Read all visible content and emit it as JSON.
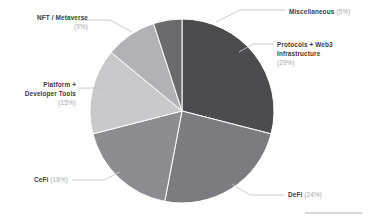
{
  "chart_data": {
    "type": "pie",
    "title": "",
    "subtitle": "",
    "xlabel": "",
    "ylabel": "",
    "grid": false,
    "legend_position": "callout-labels",
    "total_percent": 100,
    "start_angle_deg": 0,
    "direction": "clockwise",
    "categories": [
      "Protocols + Web3 Infrastructure",
      "DeFi",
      "CeFi",
      "Platform + Developer Tools",
      "NFT / Metaverse",
      "Miscellaneous"
    ],
    "values": [
      29,
      24,
      18,
      15,
      9,
      5
    ],
    "slices": [
      {
        "name": "Protocols + Web3 Infrastructure",
        "name_line1": "Protocols + Web3",
        "name_line2": "Infrastructure",
        "percent": 29,
        "percent_label": "(29%)",
        "color": "#4c4c4e",
        "label_side": "right"
      },
      {
        "name": "DeFi",
        "percent": 24,
        "percent_label": "(24%)",
        "color": "#7c7c80",
        "label_side": "right"
      },
      {
        "name": "CeFi",
        "percent": 18,
        "percent_label": "(18%)",
        "color": "#8d8d91",
        "label_side": "left"
      },
      {
        "name": "Platform + Developer Tools",
        "name_line1": "Platform +",
        "name_line2": "Developer Tools",
        "percent": 15,
        "percent_label": "(15%)",
        "color": "#c9c9cb",
        "label_side": "left"
      },
      {
        "name": "NFT / Metaverse",
        "percent": 9,
        "percent_label": "(9%)",
        "color": "#b2b2b6",
        "label_side": "left"
      },
      {
        "name": "Miscellaneous",
        "percent": 5,
        "percent_label": "(5%)",
        "color": "#6b6b6e",
        "label_side": "right"
      }
    ]
  }
}
